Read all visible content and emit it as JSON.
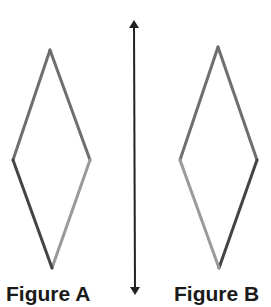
{
  "diagram": {
    "type": "reflection",
    "line_of_reflection": {
      "orientation": "vertical",
      "x": 134,
      "y_top": 18,
      "y_bottom": 297,
      "color": "#222222",
      "arrowheads": "both"
    },
    "figures": [
      {
        "label": "Figure A",
        "shape": "rhombus",
        "vertices": {
          "top": [
            50,
            50
          ],
          "right": [
            90,
            160
          ],
          "bottom": [
            52,
            268
          ],
          "left": [
            13,
            160
          ]
        },
        "edge_colors": {
          "top_left": "#6e6e6e",
          "top_right": "#6e6e6e",
          "bottom_right": "#9a9a9a",
          "bottom_left": "#444444"
        }
      },
      {
        "label": "Figure B",
        "shape": "rhombus",
        "vertices": {
          "top": [
            218,
            47
          ],
          "right": [
            257,
            160
          ],
          "bottom": [
            219,
            268
          ],
          "left": [
            180,
            160
          ]
        },
        "edge_colors": {
          "top_left": "#6e6e6e",
          "top_right": "#6e6e6e",
          "bottom_right": "#444444",
          "bottom_left": "#9a9a9a"
        }
      }
    ]
  }
}
